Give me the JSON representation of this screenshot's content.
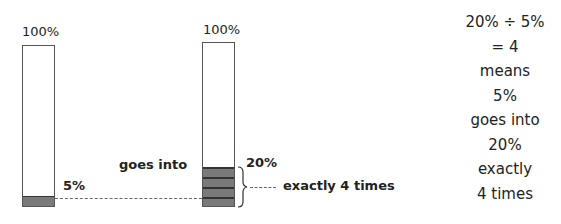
{
  "left_bar": {
    "top_label": "100%",
    "part_label": "5%",
    "part_percent": 5
  },
  "right_bar": {
    "top_label": "100%",
    "part_label": "20%",
    "part_percent": 20,
    "segments": 4
  },
  "middle_label": "goes into",
  "brace_label": "exactly 4 times",
  "explanation": [
    "20% ÷ 5%",
    "= 4",
    "means",
    "5%",
    "goes into",
    "20%",
    "exactly",
    "4 times"
  ],
  "colors": {
    "fill": "#7a7a7a",
    "outline": "#555555"
  }
}
